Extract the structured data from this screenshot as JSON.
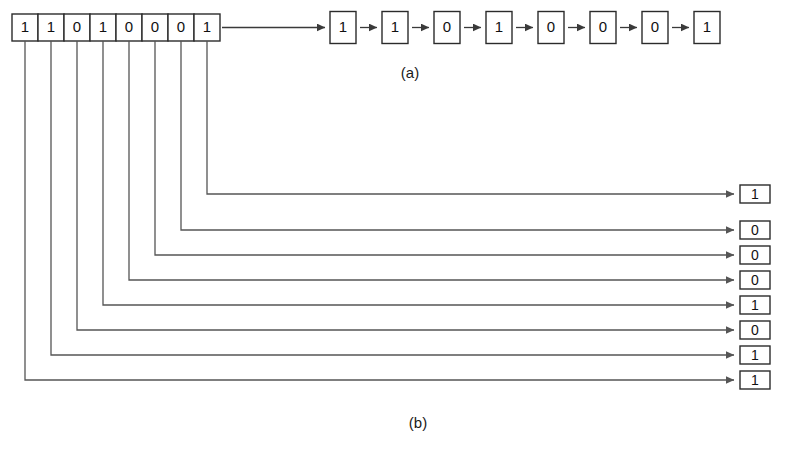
{
  "figure": {
    "panels": [
      {
        "id": "a",
        "caption": "(a)"
      },
      {
        "id": "b",
        "caption": "(b)"
      }
    ]
  },
  "source": {
    "name": "input-bit-string",
    "bits": [
      "1",
      "1",
      "0",
      "1",
      "0",
      "0",
      "0",
      "1"
    ]
  },
  "panel_a": {
    "caption": "(a)",
    "chain_bits": [
      "1",
      "1",
      "0",
      "1",
      "0",
      "0",
      "0",
      "1"
    ],
    "connector": "arrow-right"
  },
  "panel_b": {
    "caption": "(b)",
    "output_bits": [
      "1",
      "0",
      "0",
      "0",
      "1",
      "0",
      "1",
      "1"
    ],
    "connector": "arrow-right"
  },
  "chart_data": {
    "type": "diagram",
    "title": "",
    "input": [
      "1",
      "1",
      "0",
      "1",
      "0",
      "0",
      "0",
      "1"
    ],
    "outputs": [
      {
        "panel": "(a)",
        "values": [
          "1",
          "1",
          "0",
          "1",
          "0",
          "0",
          "0",
          "1"
        ]
      },
      {
        "panel": "(b)",
        "values": [
          "1",
          "0",
          "0",
          "0",
          "1",
          "0",
          "1",
          "1"
        ]
      }
    ]
  },
  "colors": {
    "background": "#ffffff",
    "box_stroke": "#2b2b2b",
    "wire": "#555555",
    "text": "#111111"
  }
}
